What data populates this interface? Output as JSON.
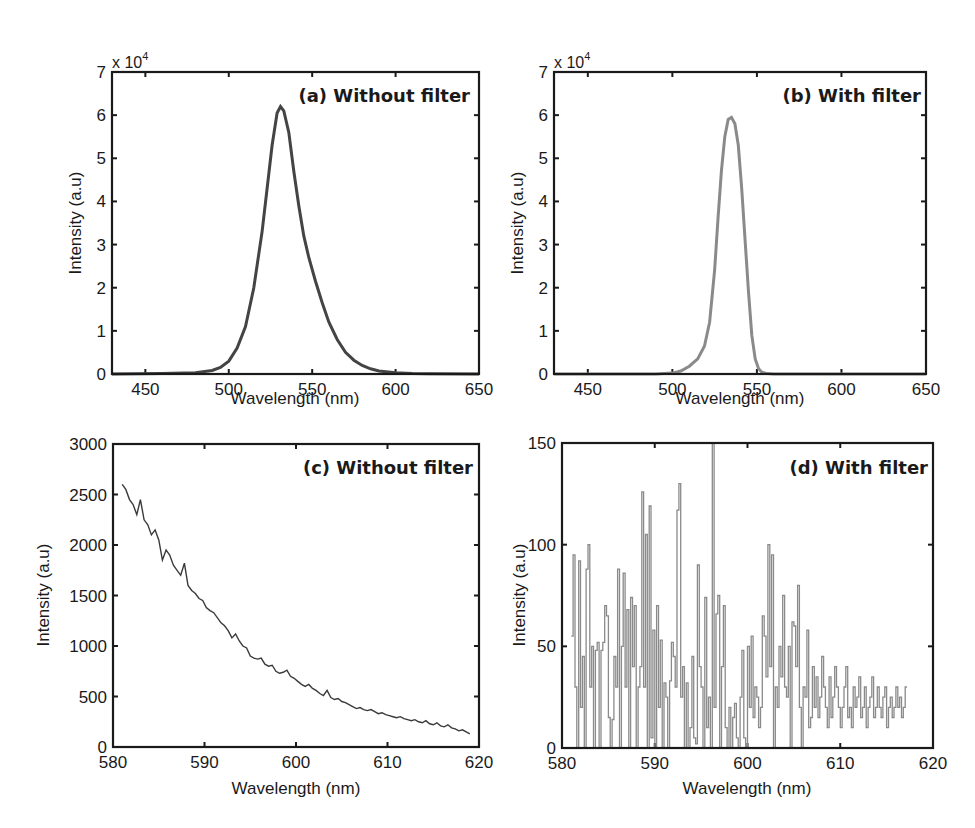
{
  "figure": {
    "panels": [
      {
        "id": "a",
        "label": "(a) Without filter",
        "xlabel": "Wavelength (nm)",
        "ylabel": "Intensity (a.u)",
        "exponent_label": "x 10",
        "exponent_power": "4",
        "xticks": [
          "450",
          "500",
          "550",
          "600",
          "650"
        ],
        "yticks": [
          "0",
          "1",
          "2",
          "3",
          "4",
          "5",
          "6",
          "7"
        ]
      },
      {
        "id": "b",
        "label": "(b) With filter",
        "xlabel": "Wavelength (nm)",
        "ylabel": "Intensity (a.u)",
        "exponent_label": "x 10",
        "exponent_power": "4",
        "xticks": [
          "450",
          "500",
          "550",
          "600",
          "650"
        ],
        "yticks": [
          "0",
          "1",
          "2",
          "3",
          "4",
          "5",
          "6",
          "7"
        ]
      },
      {
        "id": "c",
        "label": "(c) Without filter",
        "xlabel": "Wavelength (nm)",
        "ylabel": "Intensity (a.u)",
        "xticks": [
          "580",
          "590",
          "600",
          "610",
          "620"
        ],
        "yticks": [
          "0",
          "500",
          "1000",
          "1500",
          "2000",
          "2500",
          "3000"
        ]
      },
      {
        "id": "d",
        "label": "(d) With filter",
        "xlabel": "Wavelength (nm)",
        "ylabel": "Intensity (a.u)",
        "xticks": [
          "580",
          "590",
          "600",
          "610",
          "620"
        ],
        "yticks": [
          "0",
          "50",
          "100",
          "150"
        ]
      }
    ]
  },
  "chart_data": [
    {
      "type": "line",
      "title": "(a) Without filter",
      "xlabel": "Wavelength (nm)",
      "ylabel": "Intensity (a.u)",
      "y_scale_note": "x 10^4",
      "xlim": [
        430,
        650
      ],
      "ylim": [
        0,
        70000
      ],
      "grid": false,
      "line_color": "#444444",
      "box": {
        "left": 112,
        "top": 72,
        "right": 479,
        "bottom": 374
      },
      "x": [
        430,
        460,
        480,
        490,
        495,
        500,
        505,
        510,
        515,
        520,
        523,
        526,
        529,
        531,
        533,
        536,
        539,
        542,
        545,
        548,
        552,
        556,
        560,
        565,
        570,
        575,
        580,
        585,
        590,
        600,
        610,
        620,
        650
      ],
      "y": [
        0,
        100,
        300,
        800,
        1500,
        3000,
        6000,
        11000,
        20000,
        33000,
        43000,
        53000,
        60500,
        62000,
        61000,
        56000,
        47000,
        39000,
        32000,
        27000,
        21500,
        16500,
        12000,
        8000,
        5000,
        3200,
        2000,
        1200,
        700,
        300,
        150,
        80,
        0
      ]
    },
    {
      "type": "line",
      "title": "(b) With filter",
      "xlabel": "Wavelength (nm)",
      "ylabel": "Intensity (a.u)",
      "y_scale_note": "x 10^4",
      "xlim": [
        430,
        650
      ],
      "ylim": [
        0,
        70000
      ],
      "grid": false,
      "line_color": "#8a8a8a",
      "box": {
        "left": 554,
        "top": 72,
        "right": 926,
        "bottom": 374
      },
      "x": [
        430,
        490,
        500,
        505,
        510,
        515,
        519,
        522,
        525,
        527,
        529,
        531,
        533,
        535,
        537,
        539,
        541,
        543,
        545,
        547,
        549,
        551,
        553,
        556,
        560,
        570,
        650
      ],
      "y": [
        0,
        0,
        200,
        700,
        1800,
        3500,
        6500,
        12000,
        24000,
        36000,
        47000,
        55000,
        59000,
        59500,
        58000,
        53000,
        43000,
        31000,
        19000,
        9000,
        3500,
        1200,
        400,
        100,
        0,
        0,
        0
      ]
    },
    {
      "type": "line",
      "title": "(c) Without filter",
      "xlabel": "Wavelength (nm)",
      "ylabel": "Intensity (a.u)",
      "xlim": [
        580,
        620
      ],
      "ylim": [
        0,
        3000
      ],
      "grid": false,
      "line_color": "#3a3a3a",
      "box": {
        "left": 113,
        "top": 444,
        "right": 479,
        "bottom": 747
      },
      "x": [
        581.0,
        581.4,
        581.8,
        582.2,
        582.6,
        583.0,
        583.4,
        583.8,
        584.2,
        584.6,
        585.0,
        585.4,
        585.8,
        586.2,
        586.6,
        587.0,
        587.4,
        587.8,
        588.2,
        588.6,
        589.0,
        589.4,
        589.8,
        590.2,
        590.6,
        591.0,
        591.4,
        591.8,
        592.2,
        592.6,
        593.0,
        593.4,
        593.8,
        594.2,
        594.6,
        595.0,
        595.4,
        595.8,
        596.2,
        596.6,
        597.0,
        597.4,
        597.8,
        598.2,
        598.6,
        599.0,
        599.4,
        599.8,
        600.2,
        600.6,
        601.0,
        601.4,
        601.8,
        602.2,
        602.6,
        603.0,
        603.4,
        603.8,
        604.2,
        604.6,
        605.0,
        605.4,
        605.8,
        606.2,
        606.6,
        607.0,
        607.4,
        607.8,
        608.2,
        608.6,
        609.0,
        609.4,
        609.8,
        610.2,
        610.6,
        611.0,
        611.4,
        611.8,
        612.2,
        612.6,
        613.0,
        613.4,
        613.8,
        614.2,
        614.6,
        615.0,
        615.4,
        615.8,
        616.2,
        616.6,
        617.0,
        617.4,
        617.8,
        618.2,
        618.6,
        619.0
      ],
      "y": [
        2600,
        2550,
        2450,
        2400,
        2300,
        2450,
        2250,
        2200,
        2100,
        2150,
        2050,
        1850,
        1950,
        1900,
        1800,
        1750,
        1700,
        1820,
        1600,
        1550,
        1520,
        1470,
        1450,
        1380,
        1350,
        1330,
        1280,
        1230,
        1200,
        1150,
        1080,
        1120,
        1050,
        1000,
        980,
        900,
        880,
        870,
        880,
        820,
        800,
        810,
        750,
        730,
        740,
        760,
        700,
        680,
        650,
        620,
        600,
        620,
        580,
        560,
        530,
        510,
        560,
        490,
        470,
        480,
        450,
        440,
        420,
        400,
        380,
        390,
        370,
        360,
        370,
        350,
        330,
        340,
        320,
        310,
        300,
        290,
        300,
        280,
        270,
        260,
        270,
        250,
        240,
        260,
        230,
        220,
        240,
        210,
        200,
        220,
        190,
        180,
        160,
        170,
        150,
        130
      ]
    },
    {
      "type": "line",
      "title": "(d) With filter",
      "xlabel": "Wavelength (nm)",
      "ylabel": "Intensity (a.u)",
      "xlim": [
        580,
        620
      ],
      "ylim": [
        0,
        150
      ],
      "grid": false,
      "line_color": "#8a8a8a",
      "box": {
        "left": 562,
        "top": 443,
        "right": 933,
        "bottom": 748
      },
      "x": [
        581.0,
        581.2,
        581.4,
        581.6,
        581.8,
        582.0,
        582.2,
        582.4,
        582.6,
        582.8,
        583.0,
        583.2,
        583.4,
        583.6,
        583.8,
        584.0,
        584.2,
        584.4,
        584.6,
        584.8,
        585.0,
        585.2,
        585.4,
        585.6,
        585.8,
        586.0,
        586.2,
        586.4,
        586.6,
        586.8,
        587.0,
        587.2,
        587.4,
        587.6,
        587.8,
        588.0,
        588.2,
        588.4,
        588.6,
        588.8,
        589.0,
        589.2,
        589.4,
        589.6,
        589.8,
        590.0,
        590.2,
        590.4,
        590.6,
        590.8,
        591.0,
        591.2,
        591.4,
        591.6,
        591.8,
        592.0,
        592.2,
        592.4,
        592.6,
        592.8,
        593.0,
        593.2,
        593.4,
        593.6,
        593.8,
        594.0,
        594.2,
        594.4,
        594.6,
        594.8,
        595.0,
        595.2,
        595.4,
        595.6,
        595.8,
        596.0,
        596.2,
        596.4,
        596.6,
        596.8,
        597.0,
        597.2,
        597.4,
        597.6,
        597.8,
        598.0,
        598.2,
        598.4,
        598.6,
        598.8,
        599.0,
        599.2,
        599.4,
        599.6,
        599.8,
        600.0,
        600.2,
        600.4,
        600.6,
        600.8,
        601.0,
        601.2,
        601.4,
        601.6,
        601.8,
        602.0,
        602.2,
        602.4,
        602.6,
        602.8,
        603.0,
        603.2,
        603.4,
        603.6,
        603.8,
        604.0,
        604.2,
        604.4,
        604.6,
        604.8,
        605.0,
        605.2,
        605.4,
        605.6,
        605.8,
        606.0,
        606.2,
        606.4,
        606.6,
        606.8,
        607.0,
        607.2,
        607.4,
        607.6,
        607.8,
        608.0,
        608.2,
        608.4,
        608.6,
        608.8,
        609.0,
        609.2,
        609.4,
        609.6,
        609.8,
        610.0,
        610.2,
        610.4,
        610.6,
        610.8,
        611.0,
        611.2,
        611.4,
        611.6,
        611.8,
        612.0,
        612.2,
        612.4,
        612.6,
        612.8,
        613.0,
        613.2,
        613.4,
        613.6,
        613.8,
        614.0,
        614.2,
        614.4,
        614.6,
        614.8,
        615.0,
        615.2,
        615.4,
        615.6,
        615.8,
        616.0,
        616.2,
        616.4,
        616.6,
        616.8,
        617.0,
        617.2,
        617.4,
        617.6,
        617.8,
        618.0,
        618.2,
        618.4,
        618.6,
        618.8,
        619.0
      ],
      "y": [
        55,
        95,
        30,
        0,
        92,
        20,
        45,
        0,
        88,
        100,
        30,
        50,
        0,
        48,
        52,
        0,
        48,
        52,
        70,
        65,
        15,
        0,
        14,
        45,
        30,
        88,
        0,
        50,
        86,
        30,
        68,
        0,
        74,
        40,
        70,
        0,
        30,
        40,
        126,
        30,
        105,
        0,
        119,
        5,
        58,
        0,
        70,
        20,
        53,
        0,
        32,
        25,
        0,
        33,
        52,
        45,
        30,
        117,
        130,
        25,
        40,
        0,
        32,
        0,
        10,
        45,
        5,
        2,
        90,
        40,
        30,
        0,
        74,
        10,
        25,
        0,
        150,
        20,
        66,
        75,
        0,
        40,
        70,
        10,
        0,
        20,
        0,
        15,
        22,
        5,
        0,
        25,
        48,
        5,
        0,
        50,
        20,
        55,
        15,
        30,
        25,
        10,
        20,
        65,
        55,
        35,
        100,
        40,
        95,
        0,
        30,
        20,
        50,
        35,
        75,
        30,
        25,
        50,
        0,
        62,
        60,
        40,
        80,
        20,
        0,
        30,
        25,
        58,
        10,
        15,
        40,
        20,
        35,
        15,
        25,
        45,
        30,
        20,
        10,
        35,
        15,
        25,
        40,
        30,
        20,
        10,
        20,
        30,
        40,
        15,
        20,
        10,
        30,
        20,
        25,
        35,
        15,
        20,
        30,
        10,
        20,
        25,
        35,
        15,
        20,
        30,
        20,
        15,
        25,
        30,
        10,
        20,
        25,
        15,
        20,
        30,
        20,
        25,
        15,
        20,
        30
      ]
    }
  ]
}
